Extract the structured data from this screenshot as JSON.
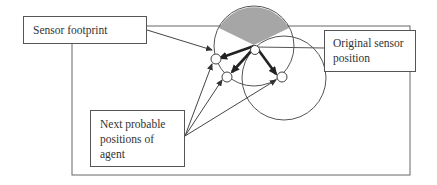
{
  "diagram": {
    "labels": {
      "sensor_footprint": "Sensor footprint",
      "original_sensor_position_line1": "Original sensor",
      "original_sensor_position_line2": "position",
      "next_positions_line1": "Next probable",
      "next_positions_line2": "positions of",
      "next_positions_line3": "agent"
    },
    "colors": {
      "stroke": "#555555",
      "sector_fill": "#a6a6a6",
      "thick_arrow": "#222222"
    }
  }
}
